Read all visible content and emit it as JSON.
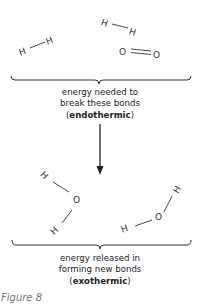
{
  "reactants": {
    "molecules": [
      {
        "name": "H2",
        "atoms": [
          "H",
          "H"
        ],
        "bond": "single"
      },
      {
        "name": "H2",
        "atoms": [
          "H",
          "H"
        ],
        "bond": "single"
      },
      {
        "name": "O2",
        "atoms": [
          "O",
          "O"
        ],
        "bond": "double"
      }
    ]
  },
  "top_caption": {
    "line1": "energy needed to",
    "line2": "break these bonds",
    "open_paren": "(",
    "bold": "endothermic",
    "close_paren": ")"
  },
  "products": {
    "molecules": [
      {
        "name": "H2O",
        "atoms": [
          "H",
          "O",
          "H"
        ]
      },
      {
        "name": "H2O",
        "atoms": [
          "H",
          "O",
          "H"
        ]
      }
    ]
  },
  "bottom_caption": {
    "line1": "energy released in",
    "line2": "forming new bonds",
    "open_paren": "(",
    "bold": "exothermic",
    "close_paren": ")"
  },
  "figure_label": "Figure 8",
  "colors": {
    "line": "#333333",
    "text": "#222222",
    "figure_label": "#777777"
  }
}
